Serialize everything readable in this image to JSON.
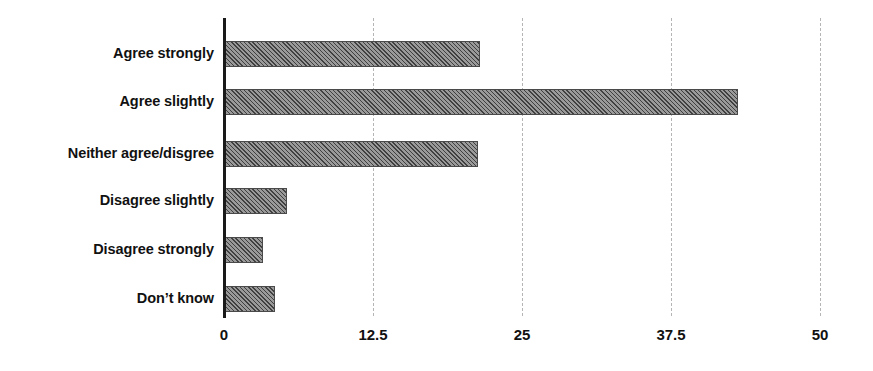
{
  "chart_data": {
    "type": "bar",
    "orientation": "horizontal",
    "title": "",
    "subtitle": "",
    "xlabel": "",
    "ylabel": "",
    "categories": [
      "Agree strongly",
      "Agree slightly",
      "Neither agree/disgree",
      "Disagree slightly",
      "Disagree strongly",
      "Don’t know"
    ],
    "values": [
      21.5,
      43.1,
      21.3,
      5.3,
      3.3,
      4.3
    ],
    "xlim": [
      0,
      50
    ],
    "xticks": [
      0,
      12.5,
      25,
      37.5,
      50
    ],
    "xtick_labels": [
      "0",
      "12.5",
      "25",
      "37.5",
      "50"
    ],
    "grid": true,
    "grid_axis": "x",
    "grid_style": "dashed",
    "legend": false,
    "legend_position": "none",
    "bar_fill": "diagonal-hatch",
    "colors": {
      "bar_fill": "#6e6e6e",
      "bar_edge": "#4a4a4a",
      "axis_line": "#1a1a1a",
      "gridline": "#b5b5b5",
      "text": "#111111",
      "background": "#ffffff"
    }
  }
}
